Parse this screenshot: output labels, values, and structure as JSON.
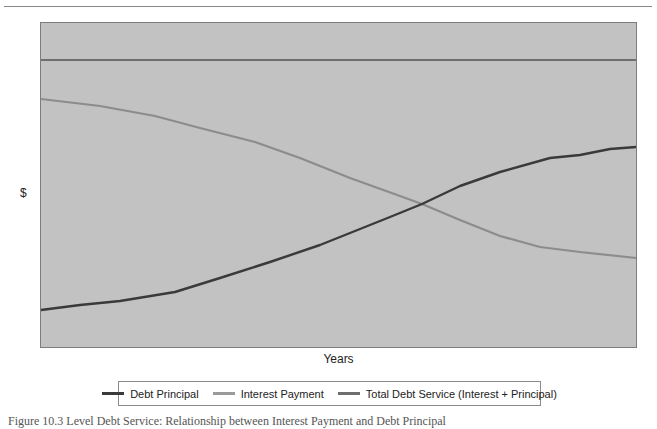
{
  "chart_data": {
    "type": "line",
    "title": "",
    "xlabel": "Years",
    "ylabel": "$",
    "grid": false,
    "legend_position": "bottom",
    "x_ticks": [],
    "y_ticks": [],
    "x": [
      0,
      1,
      2,
      3,
      4,
      5,
      6,
      7,
      8,
      9,
      10,
      11,
      12,
      13,
      14
    ],
    "series": [
      {
        "name": "Debt Principal",
        "color": "#3a3a3a",
        "values": [
          13,
          14.7,
          16.2,
          19.3,
          24.2,
          29.6,
          35.4,
          45.2,
          56.2,
          62.4,
          67.3,
          72.2,
          73.3,
          75.4,
          76.1
        ]
      },
      {
        "name": "Interest Payment",
        "color": "#8c8c8c",
        "values": [
          87,
          84.6,
          81.1,
          76.8,
          71.9,
          66.3,
          59.3,
          53.0,
          50.2,
          44.6,
          38.9,
          35.1,
          33.3,
          31.2,
          29.1
        ]
      },
      {
        "name": "Total Debt Service (Interest + Principal)",
        "color": "#6e6e6e",
        "values": [
          100,
          100,
          100,
          100,
          100,
          100,
          100,
          100,
          100,
          100,
          100,
          100,
          100,
          100,
          100
        ]
      }
    ],
    "note": "Values are relative (0-100 scale) estimated from pixel positions; axes have no tick labels.",
    "plot_px": {
      "left": 41,
      "top": 22,
      "right": 636,
      "bottom": 347
    },
    "paths_px": {
      "principal": [
        [
          41,
          310
        ],
        [
          80,
          305
        ],
        [
          120,
          301
        ],
        [
          175,
          292
        ],
        [
          220,
          278
        ],
        [
          270,
          262
        ],
        [
          320,
          245
        ],
        [
          390,
          217
        ],
        [
          422,
          204
        ],
        [
          460,
          186
        ],
        [
          500,
          172
        ],
        [
          550,
          158
        ],
        [
          580,
          155
        ],
        [
          610,
          149
        ],
        [
          636,
          147
        ]
      ],
      "interest": [
        [
          41,
          99
        ],
        [
          100,
          106
        ],
        [
          155,
          116
        ],
        [
          200,
          128
        ],
        [
          255,
          142
        ],
        [
          300,
          158
        ],
        [
          350,
          178
        ],
        [
          400,
          196
        ],
        [
          422,
          204
        ],
        [
          460,
          220
        ],
        [
          500,
          236
        ],
        [
          540,
          247
        ],
        [
          580,
          252
        ],
        [
          636,
          258
        ]
      ],
      "total": [
        [
          41,
          60
        ],
        [
          636,
          60
        ]
      ]
    }
  },
  "axes": {
    "ylabel": "$",
    "xlabel": "Years"
  },
  "legend": {
    "items": [
      {
        "label": "Debt Principal",
        "color": "#3a3a3a"
      },
      {
        "label": "Interest Payment",
        "color": "#9a9a9a"
      },
      {
        "label": "Total Debt Service (Interest + Principal)",
        "color": "#6e6e6e"
      }
    ]
  },
  "caption": "Figure 10.3  Level Debt Service: Relationship between Interest Payment and Debt Principal",
  "colors": {
    "plot_bg": "#c2c2c2",
    "plot_border": "#7d7d7d",
    "page_bg": "#ffffff"
  }
}
